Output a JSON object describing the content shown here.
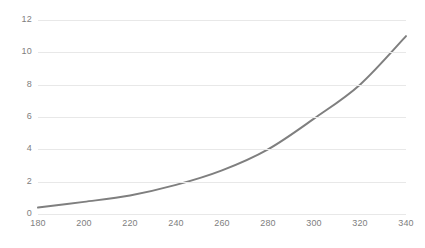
{
  "chart_data": {
    "type": "line",
    "title": "",
    "subtitle": "",
    "xlabel": "",
    "ylabel": "",
    "x": [
      180,
      200,
      220,
      240,
      260,
      280,
      300,
      320,
      340
    ],
    "series": [
      {
        "name": "series-1",
        "values": [
          0.4,
          0.75,
          1.15,
          1.8,
          2.7,
          4.0,
          5.9,
          8.0,
          11.0
        ],
        "color": "#7f7f7f",
        "line_width": 2,
        "markers": false,
        "smooth": true
      }
    ],
    "xlim": [
      180,
      340
    ],
    "ylim": [
      0,
      12
    ],
    "x_ticks": [
      180,
      200,
      220,
      240,
      260,
      280,
      300,
      320,
      340
    ],
    "y_ticks": [
      0,
      2,
      4,
      6,
      8,
      10,
      12
    ],
    "x_tick_labels": [
      "180",
      "200",
      "220",
      "240",
      "260",
      "280",
      "300",
      "320",
      "340"
    ],
    "y_tick_labels": [
      "0",
      "2",
      "4",
      "6",
      "8",
      "10",
      "12"
    ],
    "grid": {
      "horizontal": true,
      "vertical": false,
      "color": "#e8e8e8"
    },
    "legend": {
      "visible": false,
      "position": "none",
      "entries": []
    },
    "annotations": [],
    "background_color": "#ffffff",
    "tick_label_color": "#808080",
    "axis_line_visible": false
  }
}
